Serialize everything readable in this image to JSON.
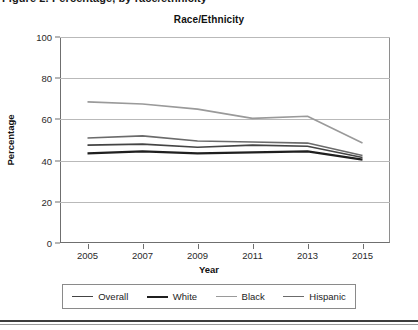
{
  "top_clipped_text": "Figure 2. Percentage, by race/ethnicity",
  "chart": {
    "title": "Race/Ethnicity",
    "xlabel": "Year",
    "ylabel": "Percentage"
  },
  "legend": {
    "items": [
      {
        "label": "Overall",
        "color": "#444444",
        "width": 1.6
      },
      {
        "label": "White",
        "color": "#1f1f1f",
        "width": 2.2
      },
      {
        "label": "Black",
        "color": "#9a9a9a",
        "width": 1.6
      },
      {
        "label": "Hispanic",
        "color": "#6b6b6b",
        "width": 1.6
      }
    ]
  },
  "chart_data": {
    "type": "line",
    "title": "Race/Ethnicity",
    "xlabel": "Year",
    "ylabel": "Percentage",
    "xlim": [
      2004,
      2016
    ],
    "ylim": [
      0,
      100
    ],
    "grid": true,
    "legend_position": "bottom",
    "x": [
      2005,
      2007,
      2009,
      2011,
      2013,
      2015
    ],
    "xtick_labels": [
      "2005",
      "2007",
      "2009",
      "2011",
      "2013",
      "2015"
    ],
    "ytick_labels": [
      "0",
      "20",
      "40",
      "60",
      "80",
      "100"
    ],
    "yticks": [
      0,
      20,
      40,
      60,
      80,
      100
    ],
    "series": [
      {
        "name": "Overall",
        "color": "#444444",
        "width": 1.6,
        "values": [
          47.5,
          48.0,
          46.5,
          47.5,
          47.0,
          41.5
        ]
      },
      {
        "name": "White",
        "color": "#1f1f1f",
        "width": 2.2,
        "values": [
          43.5,
          44.5,
          43.5,
          44.0,
          44.5,
          40.5
        ]
      },
      {
        "name": "Black",
        "color": "#9a9a9a",
        "width": 1.6,
        "values": [
          68.5,
          67.5,
          65.0,
          60.5,
          61.5,
          48.5
        ]
      },
      {
        "name": "Hispanic",
        "color": "#6b6b6b",
        "width": 1.6,
        "values": [
          51.0,
          52.0,
          49.5,
          49.0,
          48.5,
          42.5
        ]
      }
    ]
  }
}
